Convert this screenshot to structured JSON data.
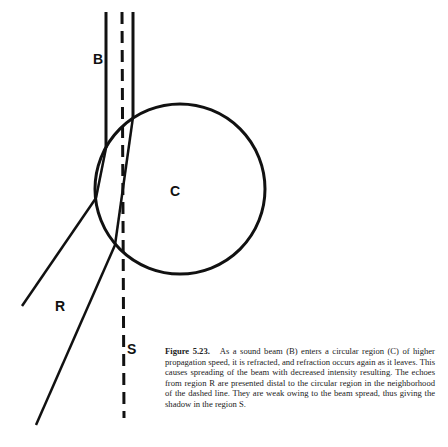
{
  "figure": {
    "labels": {
      "beam": "B",
      "circle": "C",
      "refracted_region": "R",
      "shadow": "S"
    },
    "caption": {
      "number": "Figure 5.23.",
      "text": "As a sound beam (B) enters a circular region (C) of higher propagation speed, it is refracted, and refraction occurs again as it leaves. This causes spreading of the beam with decreased intensity resulting. The echoes from region R are presented distal to the circular region in the neighborhood of the dashed line. They are weak owing to the beam spread, thus giving the shadow in the region S."
    },
    "colors": {
      "stroke": "#111111",
      "background": "#ffffff"
    }
  }
}
